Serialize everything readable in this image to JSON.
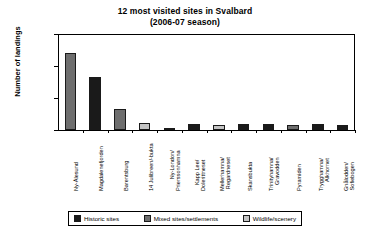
{
  "chart_data": {
    "type": "bar",
    "title": "12 most visited sites in Svalbard",
    "subtitle": "(2006-07 season)",
    "xlabel": "",
    "ylabel": "Number of landings",
    "ylim": [
      0,
      30000
    ],
    "yticks": [
      0,
      10000,
      20000,
      30000
    ],
    "ytick_labels": [
      "0",
      "10000",
      "20000",
      "30000"
    ],
    "grid": false,
    "legend_position": "bottom",
    "categories": [
      "Ny-Ålesund",
      "Magdalenefjorden",
      "Barentsburg",
      "14 Julibreen/-bukta",
      "Ny-London/ Prierssonhamna",
      "Kapp Lee/ Dolerittneset",
      "Mellerhamna/ Regardneset",
      "Skansbukta",
      "Trinityhamna/ Gravodden",
      "Pyramiden",
      "Trygghamna/ Alkhornet",
      "Gnålodden/ Sofiebogen"
    ],
    "category_lines": [
      [
        "Ny-Ålesund"
      ],
      [
        "Magdalenefjorden"
      ],
      [
        "Barentsburg"
      ],
      [
        "14 Julibreen/-bukta"
      ],
      [
        "Ny-London/",
        "Prierssonhamna"
      ],
      [
        "Kapp Lee/",
        "Dolerittneset"
      ],
      [
        "Mellerhamna/",
        "Regardneset"
      ],
      [
        "Skansbukta"
      ],
      [
        "Trinityhamna/",
        "Gravodden"
      ],
      [
        "Pyramiden"
      ],
      [
        "Trygghamna/",
        "Alkhornet"
      ],
      [
        "Gnålodden/",
        "Sofiebogen"
      ]
    ],
    "values": [
      24000,
      16500,
      6700,
      2200,
      500,
      1800,
      1700,
      1900,
      1900,
      1500,
      1800,
      1600
    ],
    "point_categories": [
      "mixed",
      "historic",
      "mixed",
      "wildlife",
      "historic",
      "historic",
      "wildlife",
      "historic",
      "historic",
      "mixed",
      "historic",
      "historic"
    ],
    "series": [
      {
        "name": "Number of landings",
        "values": [
          24000,
          16500,
          6700,
          2200,
          500,
          1800,
          1700,
          1900,
          1900,
          1500,
          1800,
          1600
        ]
      }
    ]
  },
  "legend": {
    "items": [
      {
        "label": "Historic sites",
        "key": "historic",
        "color": "#1a1a1a"
      },
      {
        "label": "Mixed sites/settlements",
        "key": "mixed",
        "color": "#6e6e6e"
      },
      {
        "label": "Wildlife/scenery",
        "key": "wildlife",
        "color": "#c4c4c4"
      }
    ]
  },
  "colors": {
    "historic": "#1a1a1a",
    "mixed": "#6e6e6e",
    "wildlife": "#c4c4c4",
    "axis": "#000000",
    "background": "#ffffff"
  }
}
